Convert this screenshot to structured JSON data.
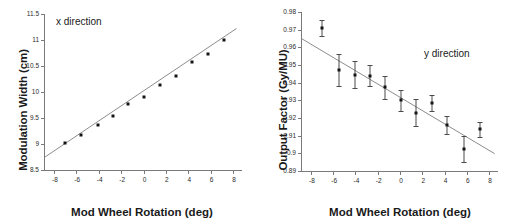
{
  "figure": {
    "panels": [
      {
        "key": "x-direction",
        "annotation": "x direction",
        "xlabel": "Mod Wheel Rotation (deg)",
        "ylabel": "Modulation Width (cm)"
      },
      {
        "key": "y-direction",
        "annotation": "y direction",
        "xlabel": "Mod Wheel Rotation (deg)",
        "ylabel": "Output Factor (Gy/MU)"
      }
    ]
  },
  "chart_data": [
    {
      "type": "scatter",
      "title": "x direction",
      "xlabel": "Mod Wheel Rotation (deg)",
      "ylabel": "Modulation Width (cm)",
      "xlim": [
        -8.8,
        8.8
      ],
      "ylim": [
        8.5,
        11.5
      ],
      "xticks": [
        -8,
        -6,
        -4,
        -2,
        0,
        2,
        4,
        6,
        8
      ],
      "xtick_labels": [
        "-8",
        "-6",
        "-4",
        "-2",
        "0",
        "2",
        "4",
        "6",
        "8"
      ],
      "yticks": [
        8.5,
        9,
        9.5,
        10,
        10.5,
        11,
        11.5
      ],
      "ytick_labels": [
        "8.5",
        "9",
        "9.5",
        "10",
        "10.5",
        "11",
        "11.5"
      ],
      "grid": false,
      "legend": "none",
      "marker": "filled-square",
      "x": [
        -7.0,
        -5.6,
        -4.1,
        -2.7,
        -1.35,
        0.05,
        1.5,
        2.9,
        4.3,
        5.8,
        7.2
      ],
      "y": [
        9.02,
        9.18,
        9.36,
        9.54,
        9.77,
        9.9,
        10.13,
        10.31,
        10.57,
        10.73,
        11.0
      ],
      "fit": {
        "type": "linear",
        "x0": -8.8,
        "y0": 8.75,
        "x1": 8.3,
        "y1": 11.22
      }
    },
    {
      "type": "scatter",
      "title": "y direction",
      "xlabel": "Mod Wheel Rotation (deg)",
      "ylabel": "Output Factor (Gy/MU)",
      "xlim": [
        -8.8,
        8.8
      ],
      "ylim": [
        0.89,
        0.98
      ],
      "xticks": [
        -8,
        -6,
        -4,
        -2,
        0,
        2,
        4,
        6,
        8
      ],
      "xtick_labels": [
        "-8",
        "-6",
        "-4",
        "-2",
        "0",
        "2",
        "4",
        "6",
        "8"
      ],
      "yticks": [
        0.89,
        0.9,
        0.91,
        0.92,
        0.93,
        0.94,
        0.95,
        0.96,
        0.97,
        0.98
      ],
      "ytick_labels": [
        "0.89",
        "0.9",
        "0.91",
        "0.92",
        "0.93",
        "0.94",
        "0.95",
        "0.96",
        "0.97",
        "0.98"
      ],
      "grid": false,
      "legend": "none",
      "marker": "filled-square-with-errorbars",
      "x": [
        -7.0,
        -5.5,
        -4.05,
        -2.65,
        -1.35,
        0.05,
        1.45,
        2.9,
        4.25,
        5.75,
        7.2
      ],
      "y": [
        0.971,
        0.947,
        0.9445,
        0.944,
        0.9375,
        0.93,
        0.923,
        0.9285,
        0.916,
        0.9025,
        0.9135
      ],
      "yerr": [
        0.0045,
        0.009,
        0.0075,
        0.006,
        0.0065,
        0.0058,
        0.0078,
        0.0045,
        0.005,
        0.0072,
        0.004
      ],
      "fit": {
        "type": "linear",
        "x0": -8.8,
        "y0": 0.9648,
        "x1": 8.5,
        "y1": 0.8998
      }
    }
  ]
}
